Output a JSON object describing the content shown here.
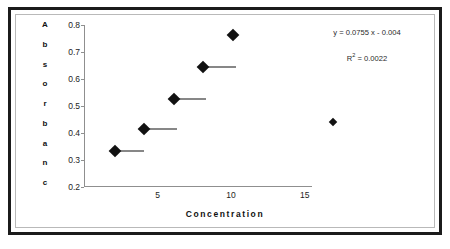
{
  "chart_data": {
    "type": "scatter",
    "title": "",
    "xlabel": "Concentration",
    "ylabel": "Absorbance",
    "ylabel_letters": [
      "A",
      "b",
      "s",
      "o",
      "r",
      "b",
      "a",
      "n",
      "c"
    ],
    "xlim": [
      0,
      15.5
    ],
    "ylim": [
      0.2,
      0.8
    ],
    "xticks": [
      5,
      10,
      15
    ],
    "xtick_labels": [
      "5",
      "10",
      "15"
    ],
    "yticks": [
      0.2,
      0.3,
      0.4,
      0.5,
      0.6,
      0.7,
      0.8
    ],
    "ytick_labels": [
      "0.8",
      "0.7",
      "0.6",
      "0.5",
      "0.4",
      "0.3",
      "0.2"
    ],
    "grid": false,
    "legend": false,
    "marker": "diamond",
    "marker_color": "#111111",
    "points": [
      {
        "x": 2.1,
        "y": 0.335,
        "size": 9,
        "line_to_x": 4.1
      },
      {
        "x": 4.1,
        "y": 0.415,
        "size": 9,
        "line_to_x": 6.3
      },
      {
        "x": 6.1,
        "y": 0.525,
        "size": 9,
        "line_to_x": 8.3
      },
      {
        "x": 8.1,
        "y": 0.645,
        "size": 9,
        "line_to_x": 10.3
      },
      {
        "x": 10.1,
        "y": 0.762,
        "size": 9,
        "line_to_x": null
      },
      {
        "x": 16.9,
        "y": 0.44,
        "size": 6,
        "line_to_x": null
      }
    ],
    "annotations": {
      "equation": "y = 0.0755 x - 0.004",
      "r_squared_prefix": "R",
      "r_squared_exponent": "2",
      "r_squared_value": " = 0.0022"
    }
  },
  "style": {
    "outer_border_color": "#1b1b1b",
    "inner_border_color": "#b9b9b9",
    "axis_color": "#8f8f8f",
    "background": "#ffffff"
  }
}
